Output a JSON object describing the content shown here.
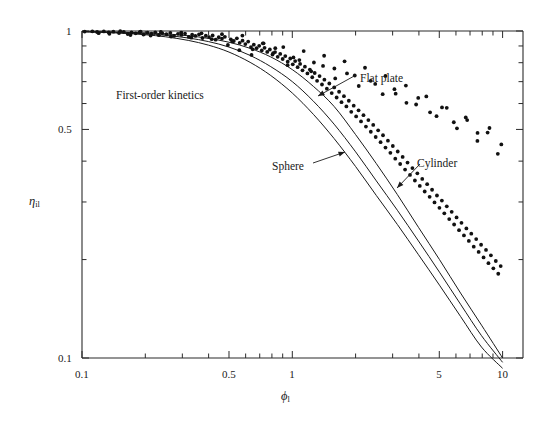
{
  "figure": {
    "note_label": "First-order kinetics",
    "background": "#ffffff",
    "ink": "#1a1a1a"
  },
  "axes": {
    "x_title_main": "ϕ",
    "x_title_sub": "l",
    "y_title_main": "η",
    "y_title_sub": "il",
    "x_tick_labels": [
      "0.1",
      "0.5",
      "1",
      "5",
      "10"
    ],
    "y_tick_labels": [
      "1",
      "0.5",
      "0.1"
    ]
  },
  "annotations": [
    {
      "text": "Flat plate",
      "x": 360,
      "y": 72
    },
    {
      "text": "Sphere",
      "x": 272,
      "y": 160
    },
    {
      "text": "Cylinder",
      "x": 417,
      "y": 157
    }
  ],
  "chart_data": {
    "type": "line",
    "title": "",
    "subtitle": "First-order kinetics",
    "xlabel": "ϕl",
    "ylabel": "ηil",
    "xscale": "log",
    "yscale": "log",
    "xlim": [
      0.1,
      10
    ],
    "ylim": [
      0.1,
      1.0
    ],
    "grid": false,
    "legend_position": "inline-annotations",
    "x_ticks": [
      0.1,
      0.5,
      1,
      5,
      10
    ],
    "y_ticks": [
      1,
      0.5,
      0.1
    ],
    "series": [
      {
        "name": "Flat plate",
        "kind": "curve",
        "formula": "tanh(phi)/phi",
        "x": [
          0.1,
          0.13,
          0.16,
          0.2,
          0.25,
          0.32,
          0.4,
          0.5,
          0.63,
          0.79,
          1.0,
          1.26,
          1.58,
          2.0,
          2.51,
          3.16,
          3.98,
          5.01,
          6.31,
          7.94,
          10.0
        ],
        "y": [
          0.997,
          0.994,
          0.991,
          0.987,
          0.98,
          0.967,
          0.949,
          0.924,
          0.885,
          0.833,
          0.762,
          0.677,
          0.588,
          0.482,
          0.393,
          0.316,
          0.251,
          0.2,
          0.158,
          0.126,
          0.1
        ]
      },
      {
        "name": "Cylinder",
        "kind": "curve",
        "formula": "2*I1(2phi)/(2phi*I0(2phi))",
        "x": [
          0.1,
          0.13,
          0.16,
          0.2,
          0.25,
          0.32,
          0.4,
          0.5,
          0.63,
          0.79,
          1.0,
          1.26,
          1.58,
          2.0,
          2.51,
          3.16,
          3.98,
          5.01,
          6.31,
          7.94,
          10.0
        ],
        "y": [
          0.995,
          0.992,
          0.987,
          0.98,
          0.97,
          0.952,
          0.928,
          0.893,
          0.842,
          0.778,
          0.7,
          0.61,
          0.519,
          0.427,
          0.348,
          0.283,
          0.228,
          0.183,
          0.146,
          0.117,
          0.097
        ]
      },
      {
        "name": "Sphere",
        "kind": "curve",
        "formula": "(1/phi)*(1/tanh(3phi)-1/(3phi))",
        "x": [
          0.1,
          0.13,
          0.16,
          0.2,
          0.25,
          0.32,
          0.4,
          0.5,
          0.63,
          0.79,
          1.0,
          1.26,
          1.58,
          2.0,
          2.51,
          3.16,
          3.98,
          5.01,
          6.31,
          7.94,
          10.0
        ],
        "y": [
          0.994,
          0.989,
          0.983,
          0.974,
          0.96,
          0.936,
          0.905,
          0.862,
          0.802,
          0.731,
          0.646,
          0.556,
          0.469,
          0.385,
          0.314,
          0.256,
          0.207,
          0.167,
          0.134,
          0.108,
          0.093
        ]
      }
    ],
    "scatter": {
      "name": "Experimental data",
      "marker": "filled-circle",
      "points": [
        [
          0.103,
          0.996
        ],
        [
          0.112,
          0.998
        ],
        [
          0.118,
          0.993
        ],
        [
          0.127,
          0.997
        ],
        [
          0.134,
          0.99
        ],
        [
          0.141,
          0.995
        ],
        [
          0.15,
          0.986
        ],
        [
          0.158,
          0.994
        ],
        [
          0.165,
          0.979
        ],
        [
          0.172,
          0.99
        ],
        [
          0.18,
          0.984
        ],
        [
          0.188,
          0.992
        ],
        [
          0.196,
          0.975
        ],
        [
          0.205,
          0.988
        ],
        [
          0.214,
          0.982
        ],
        [
          0.223,
          0.991
        ],
        [
          0.232,
          0.971
        ],
        [
          0.241,
          0.985
        ],
        [
          0.252,
          0.978
        ],
        [
          0.263,
          0.987
        ],
        [
          0.274,
          0.966
        ],
        [
          0.286,
          0.98
        ],
        [
          0.297,
          0.973
        ],
        [
          0.309,
          0.982
        ],
        [
          0.322,
          0.959
        ],
        [
          0.334,
          0.974
        ],
        [
          0.346,
          0.966
        ],
        [
          0.36,
          0.976
        ],
        [
          0.374,
          0.952
        ],
        [
          0.388,
          0.967
        ],
        [
          0.402,
          0.958
        ],
        [
          0.418,
          0.969
        ],
        [
          0.432,
          0.941
        ],
        [
          0.447,
          0.957
        ],
        [
          0.463,
          0.948
        ],
        [
          0.478,
          0.96
        ],
        [
          0.494,
          0.906
        ],
        [
          0.51,
          0.943
        ],
        [
          0.527,
          0.932
        ],
        [
          0.545,
          0.95
        ],
        [
          0.562,
          0.92
        ],
        [
          0.58,
          0.934
        ],
        [
          0.598,
          0.912
        ],
        [
          0.617,
          0.928
        ],
        [
          0.636,
          0.893
        ],
        [
          0.656,
          0.908
        ],
        [
          0.676,
          0.886
        ],
        [
          0.696,
          0.901
        ],
        [
          0.716,
          0.872
        ],
        [
          0.738,
          0.888
        ],
        [
          0.76,
          0.863
        ],
        [
          0.782,
          0.878
        ],
        [
          0.805,
          0.847
        ],
        [
          0.828,
          0.862
        ],
        [
          0.852,
          0.834
        ],
        [
          0.876,
          0.851
        ],
        [
          0.9,
          0.821
        ],
        [
          0.926,
          0.838
        ],
        [
          0.951,
          0.806
        ],
        [
          0.978,
          0.824
        ],
        [
          1.005,
          0.791
        ],
        [
          1.032,
          0.809
        ],
        [
          1.06,
          0.775
        ],
        [
          1.089,
          0.793
        ],
        [
          1.118,
          0.758
        ],
        [
          1.148,
          0.778
        ],
        [
          1.18,
          0.742
        ],
        [
          1.212,
          0.762
        ],
        [
          1.244,
          0.722
        ],
        [
          1.278,
          0.744
        ],
        [
          1.312,
          0.704
        ],
        [
          1.348,
          0.728
        ],
        [
          1.384,
          0.686
        ],
        [
          1.421,
          0.71
        ],
        [
          1.46,
          0.666
        ],
        [
          1.5,
          0.691
        ],
        [
          1.54,
          0.646
        ],
        [
          1.582,
          0.672
        ],
        [
          1.625,
          0.626
        ],
        [
          1.669,
          0.652
        ],
        [
          1.714,
          0.606
        ],
        [
          1.76,
          0.632
        ],
        [
          1.808,
          0.588
        ],
        [
          1.857,
          0.612
        ],
        [
          1.907,
          0.566
        ],
        [
          1.959,
          0.591
        ],
        [
          2.012,
          0.548
        ],
        [
          2.066,
          0.572
        ],
        [
          2.122,
          0.529
        ],
        [
          2.18,
          0.553
        ],
        [
          2.239,
          0.51
        ],
        [
          2.3,
          0.534
        ],
        [
          2.362,
          0.492
        ],
        [
          2.426,
          0.516
        ],
        [
          2.492,
          0.474
        ],
        [
          2.56,
          0.497
        ],
        [
          2.629,
          0.457
        ],
        [
          2.7,
          0.48
        ],
        [
          2.774,
          0.44
        ],
        [
          2.849,
          0.462
        ],
        [
          2.927,
          0.424
        ],
        [
          3.006,
          0.445
        ],
        [
          3.088,
          0.407
        ],
        [
          3.172,
          0.428
        ],
        [
          3.258,
          0.392
        ],
        [
          3.347,
          0.412
        ],
        [
          3.438,
          0.377
        ],
        [
          3.531,
          0.396
        ],
        [
          3.628,
          0.363
        ],
        [
          3.726,
          0.381
        ],
        [
          3.828,
          0.349
        ],
        [
          3.932,
          0.367
        ],
        [
          4.039,
          0.336
        ],
        [
          4.149,
          0.353
        ],
        [
          4.262,
          0.323
        ],
        [
          4.378,
          0.34
        ],
        [
          4.497,
          0.311
        ],
        [
          4.62,
          0.327
        ],
        [
          4.745,
          0.299
        ],
        [
          4.874,
          0.314
        ],
        [
          5.007,
          0.288
        ],
        [
          5.143,
          0.303
        ],
        [
          5.283,
          0.277
        ],
        [
          5.427,
          0.291
        ],
        [
          5.574,
          0.266
        ],
        [
          5.726,
          0.28
        ],
        [
          5.882,
          0.256
        ],
        [
          6.042,
          0.269
        ],
        [
          6.206,
          0.246
        ],
        [
          6.375,
          0.259
        ],
        [
          6.548,
          0.237
        ],
        [
          6.727,
          0.249
        ],
        [
          6.91,
          0.228
        ],
        [
          7.098,
          0.24
        ],
        [
          7.291,
          0.219
        ],
        [
          7.489,
          0.231
        ],
        [
          7.693,
          0.211
        ],
        [
          7.902,
          0.222
        ],
        [
          8.117,
          0.203
        ],
        [
          8.338,
          0.214
        ],
        [
          8.565,
          0.195
        ],
        [
          8.798,
          0.206
        ],
        [
          9.037,
          0.188
        ],
        [
          9.283,
          0.198
        ],
        [
          9.535,
          0.181
        ],
        [
          9.794,
          0.191
        ],
        [
          0.12,
          0.985
        ],
        [
          0.135,
          0.98
        ],
        [
          0.152,
          0.999
        ],
        [
          0.17,
          0.972
        ],
        [
          0.19,
          0.996
        ],
        [
          0.212,
          0.968
        ],
        [
          0.237,
          0.993
        ],
        [
          0.265,
          0.962
        ],
        [
          0.296,
          0.989
        ],
        [
          0.331,
          0.954
        ],
        [
          0.37,
          0.984
        ],
        [
          0.414,
          0.944
        ],
        [
          0.463,
          0.978
        ],
        [
          0.518,
          0.929
        ],
        [
          0.579,
          0.968
        ],
        [
          0.648,
          0.879
        ],
        [
          0.724,
          0.917
        ],
        [
          0.81,
          0.855
        ],
        [
          0.906,
          0.893
        ],
        [
          1.013,
          0.83
        ],
        [
          1.133,
          0.868
        ],
        [
          1.267,
          0.801
        ],
        [
          1.417,
          0.84
        ],
        [
          1.585,
          0.768
        ],
        [
          1.772,
          0.808
        ],
        [
          1.982,
          0.731
        ],
        [
          2.217,
          0.772
        ],
        [
          2.479,
          0.689
        ],
        [
          2.773,
          0.729
        ],
        [
          3.101,
          0.643
        ],
        [
          3.468,
          0.681
        ],
        [
          3.879,
          0.596
        ],
        [
          4.338,
          0.631
        ],
        [
          4.851,
          0.549
        ],
        [
          5.425,
          0.582
        ],
        [
          6.067,
          0.504
        ],
        [
          6.785,
          0.534
        ],
        [
          7.588,
          0.461
        ],
        [
          8.486,
          0.489
        ],
        [
          9.491,
          0.421
        ],
        [
          0.56,
          0.874
        ],
        [
          0.64,
          0.845
        ],
        [
          0.73,
          0.917
        ],
        [
          0.83,
          0.886
        ],
        [
          0.95,
          0.786
        ],
        [
          1.08,
          0.815
        ],
        [
          1.23,
          0.753
        ],
        [
          1.4,
          0.782
        ],
        [
          1.6,
          0.716
        ],
        [
          1.82,
          0.742
        ],
        [
          2.07,
          0.679
        ],
        [
          2.36,
          0.704
        ],
        [
          2.69,
          0.641
        ],
        [
          3.06,
          0.664
        ],
        [
          3.49,
          0.603
        ],
        [
          3.97,
          0.624
        ],
        [
          4.52,
          0.564
        ],
        [
          5.15,
          0.584
        ],
        [
          5.86,
          0.526
        ],
        [
          6.68,
          0.544
        ],
        [
          7.6,
          0.488
        ],
        [
          8.66,
          0.505
        ],
        [
          9.86,
          0.45
        ]
      ]
    }
  }
}
